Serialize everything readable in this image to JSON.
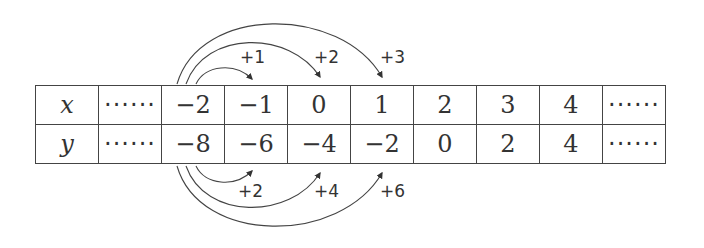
{
  "table": {
    "rows": [
      {
        "label": "x",
        "cells": [
          "······",
          "−2",
          "−1",
          "0",
          "1",
          "2",
          "3",
          "4",
          "······"
        ]
      },
      {
        "label": "y",
        "cells": [
          "······",
          "−8",
          "−6",
          "−4",
          "−2",
          "0",
          "2",
          "4",
          "······"
        ]
      }
    ]
  },
  "annotations": {
    "top": [
      "+1",
      "+2",
      "+3"
    ],
    "bottom": [
      "+2",
      "+4",
      "+6"
    ]
  }
}
